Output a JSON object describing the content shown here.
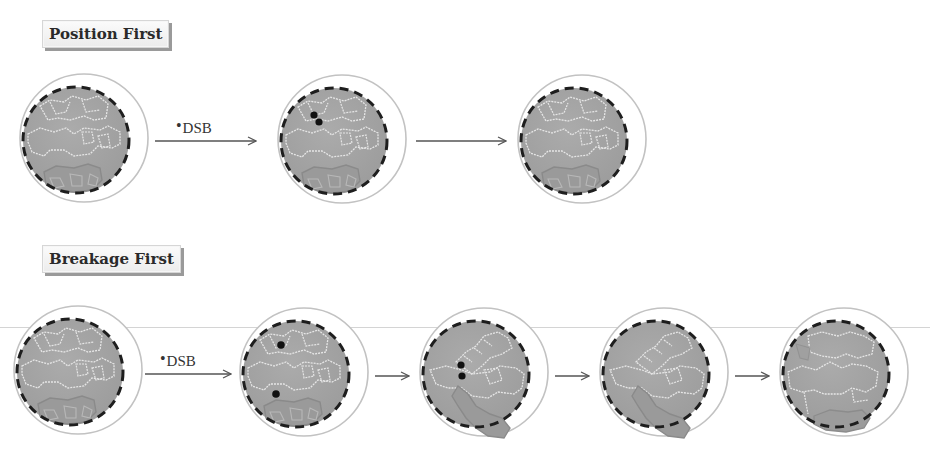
{
  "diagram": {
    "rows": [
      {
        "label": "Position First",
        "cells": [
          {
            "step": 1,
            "dsb_dots": 0
          },
          {
            "step": 2,
            "dsb_dots": 2
          },
          {
            "step": 3,
            "dsb_dots": 0
          }
        ],
        "arrows": [
          {
            "label_bullet": "•",
            "label": "DSB"
          },
          {
            "label": ""
          }
        ]
      },
      {
        "label": "Breakage First",
        "cells": [
          {
            "step": 1,
            "dsb_dots": 0
          },
          {
            "step": 2,
            "dsb_dots": 2
          },
          {
            "step": 3,
            "dsb_dots": 2
          },
          {
            "step": 4,
            "dsb_dots": 0
          },
          {
            "step": 5,
            "dsb_dots": 0
          }
        ],
        "arrows": [
          {
            "label_bullet": "•",
            "label": "DSB"
          },
          {
            "label": ""
          },
          {
            "label": ""
          },
          {
            "label": ""
          }
        ]
      }
    ],
    "colors": {
      "nucleus_fill": "#a6a6a6",
      "nucleus_border": "#222222",
      "cell_outline": "#bdbdbd",
      "chromatin_light": "#e4e4e4",
      "chromatin_dark": "#8c8c8c",
      "dsb_dot": "#111111",
      "arrow": "#555555"
    }
  }
}
